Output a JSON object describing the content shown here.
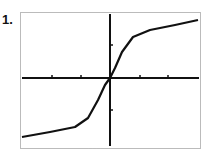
{
  "problem": {
    "number_label": "1."
  },
  "chart_data": {
    "type": "line",
    "title": "",
    "xlabel": "",
    "ylabel": "",
    "grid": false,
    "legend": null,
    "x_ticks": 6,
    "y_ticks": 2,
    "series": [
      {
        "name": "curve",
        "points_px": [
          [
            22,
            137
          ],
          [
            50,
            132
          ],
          [
            75,
            127
          ],
          [
            88,
            118
          ],
          [
            98,
            100
          ],
          [
            105,
            85
          ],
          [
            110,
            78
          ],
          [
            115,
            68
          ],
          [
            122,
            52
          ],
          [
            133,
            37
          ],
          [
            150,
            30
          ],
          [
            175,
            25
          ],
          [
            198,
            20
          ]
        ]
      }
    ],
    "colors": {
      "curve": "#111111",
      "axes": "#111111",
      "frame": "#666666"
    }
  }
}
